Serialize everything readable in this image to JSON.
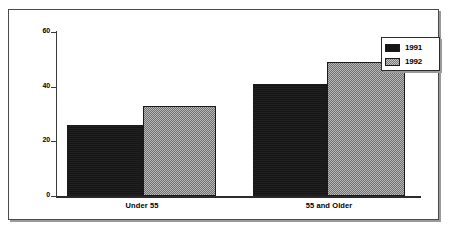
{
  "chart_data": {
    "type": "bar",
    "title": "",
    "subtitle": "",
    "xlabel": "",
    "ylabel": "",
    "categories": [
      "Under 55",
      "55 and Older"
    ],
    "series": [
      {
        "name": "1991",
        "values": [
          26,
          41
        ],
        "color": "#151515"
      },
      {
        "name": "1992",
        "values": [
          33,
          49
        ],
        "color": "#8d8d8d"
      }
    ],
    "ylim": [
      0,
      60
    ],
    "yticks": [
      0,
      20,
      40,
      60
    ],
    "ytick_labels": [
      "0",
      "20",
      "40",
      "60"
    ],
    "grid": false,
    "legend_position": "top-right",
    "legend_entries": [
      "1991",
      "1992"
    ]
  },
  "axis": {
    "ticks": [
      {
        "label": "60",
        "value": 60
      },
      {
        "label": "40",
        "value": 40
      },
      {
        "label": "20",
        "value": 20
      },
      {
        "label": "0",
        "value": 0
      }
    ]
  },
  "legend": {
    "rows": [
      {
        "label": "1991"
      },
      {
        "label": "1992"
      }
    ]
  },
  "categories": [
    {
      "label": "Under 55"
    },
    {
      "label": "55 and Older"
    }
  ]
}
